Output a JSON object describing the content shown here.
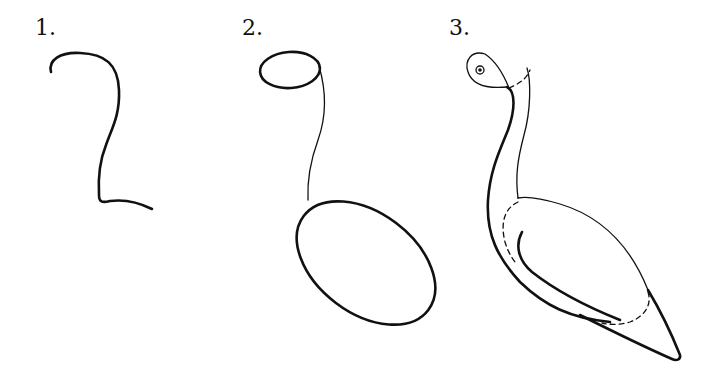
{
  "tutorial": {
    "subject": "bird",
    "steps": [
      {
        "number": "1.",
        "description": "Neck guide curve"
      },
      {
        "number": "2.",
        "description": "Head oval and body ellipse"
      },
      {
        "number": "3.",
        "description": "Refined bird outline with eye, wing, and tail"
      }
    ]
  },
  "colors": {
    "stroke": "#111111",
    "background": "#ffffff"
  }
}
